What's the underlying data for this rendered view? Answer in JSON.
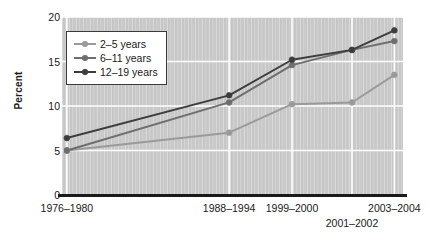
{
  "chart_data": {
    "type": "line",
    "title": "",
    "subtitle": "",
    "xlabel": "",
    "ylabel": "Percent",
    "ylim": [
      0,
      20
    ],
    "yticks": [
      0,
      5,
      10,
      15,
      20
    ],
    "ytick_labels": [
      "0",
      "5",
      "10",
      "15",
      "20"
    ],
    "categories": [
      "1976–1980",
      "1988–1994",
      "1999–2000",
      "2001–2002",
      "2003–2004"
    ],
    "category_positions": [
      0.0143,
      0.4901,
      0.6745,
      0.8504,
      0.9746
    ],
    "grid": {
      "horizontal": true,
      "vertical": true,
      "color": "#ffffff"
    },
    "legend": {
      "position": "upper-left-inside",
      "entries": [
        {
          "name": "2–5 years",
          "color": "#9a9a9a"
        },
        {
          "name": "6–11 years",
          "color": "#6e6e6e"
        },
        {
          "name": "12–19 years",
          "color": "#3d3d3d"
        }
      ]
    },
    "series": [
      {
        "name": "2–5 years",
        "color": "#9a9a9a",
        "values": [
          5.0,
          7.0,
          10.2,
          10.4,
          13.5
        ]
      },
      {
        "name": "6–11 years",
        "color": "#6e6e6e",
        "values": [
          5.0,
          10.4,
          14.6,
          16.3,
          17.3
        ]
      },
      {
        "name": "12–19 years",
        "color": "#3d3d3d",
        "values": [
          6.4,
          11.2,
          15.2,
          16.3,
          18.5
        ]
      }
    ],
    "colors": {
      "plot_background": "#c9c9c9",
      "page_background": "#ffffff",
      "gridline": "#ffffff",
      "axis": "#1a1a1a",
      "text": "#1a1a1a",
      "legend_border": "#3a3a3a",
      "legend_background": "#ffffff"
    },
    "annotations": []
  },
  "axis": {
    "y_title": "Percent"
  },
  "icons": {
    "legend_marker": "line-marker-icon"
  }
}
